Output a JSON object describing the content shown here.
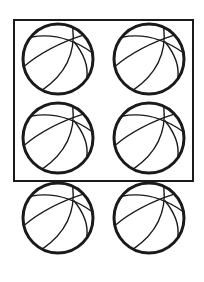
{
  "figure": {
    "total_count": 6,
    "boxed_count": 4,
    "unboxed_count": 2,
    "box": {
      "x": 14,
      "y": 20,
      "width": 179,
      "height": 161
    },
    "balls": [
      {
        "cx": 58,
        "cy": 59,
        "r": 35,
        "in_box": true
      },
      {
        "cx": 149,
        "cy": 59,
        "r": 35,
        "in_box": true
      },
      {
        "cx": 58,
        "cy": 138,
        "r": 35,
        "in_box": true
      },
      {
        "cx": 149,
        "cy": 138,
        "r": 35,
        "in_box": true
      },
      {
        "cx": 58,
        "cy": 218,
        "r": 35,
        "in_box": false
      },
      {
        "cx": 149,
        "cy": 218,
        "r": 35,
        "in_box": false
      }
    ],
    "stroke_color": "#1a1a1a"
  }
}
